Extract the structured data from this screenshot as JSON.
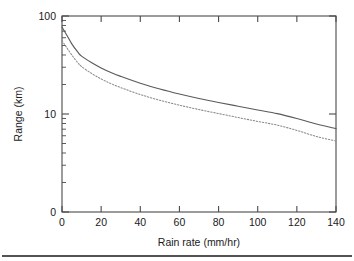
{
  "chart_data": {
    "type": "line",
    "title": "",
    "xlabel": "Rain rate (mm/hr)",
    "ylabel": "Range (km)",
    "xlim": [
      0,
      140
    ],
    "ylim": [
      1,
      100
    ],
    "yscale": "log",
    "xscale": "linear",
    "grid": false,
    "legend": null,
    "xticks": [
      0,
      20,
      40,
      60,
      80,
      100,
      120,
      140
    ],
    "xticklabels": [
      "0",
      "20",
      "40",
      "60",
      "80",
      "100",
      "120",
      "140"
    ],
    "yticks": [
      100,
      10,
      1
    ],
    "yticklabels": [
      "100",
      "10",
      "0"
    ],
    "y_minor_ticks": [
      90,
      80,
      70,
      60,
      50,
      40,
      30,
      20,
      9,
      8,
      7,
      6,
      5,
      4,
      3,
      2
    ],
    "x": [
      0,
      2,
      5,
      8,
      10,
      15,
      20,
      25,
      30,
      40,
      50,
      60,
      70,
      80,
      90,
      100,
      110,
      120,
      130,
      140
    ],
    "series": [
      {
        "name": "upper-curve",
        "style": "solid",
        "color": "#5a5a5a",
        "values": [
          77.0,
          66.0,
          52.0,
          43.0,
          39.0,
          33.5,
          29.5,
          26.5,
          24.2,
          20.6,
          18.0,
          16.0,
          14.4,
          13.1,
          12.0,
          11.0,
          10.1,
          9.0,
          7.9,
          7.1
        ]
      },
      {
        "name": "lower-curve",
        "style": "dotted",
        "color": "#8a8a8a",
        "values": [
          56.0,
          49.0,
          40.0,
          33.5,
          30.5,
          26.0,
          22.8,
          20.4,
          18.6,
          15.8,
          13.8,
          12.3,
          11.1,
          10.1,
          9.2,
          8.4,
          7.7,
          6.8,
          5.9,
          5.3
        ]
      }
    ]
  },
  "figure": {
    "background": "#ffffff",
    "frame_color": "#4a4a4a",
    "footer_rule_color": "#1a1a1a"
  }
}
